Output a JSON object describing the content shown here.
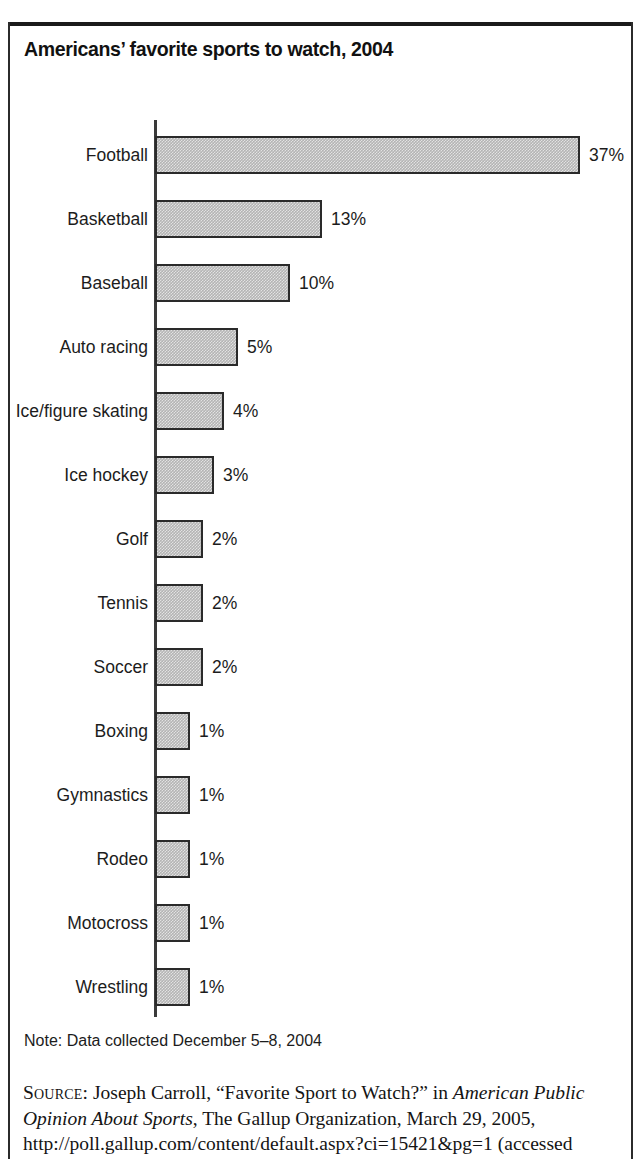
{
  "figure": {
    "title": "Americans’ favorite sports to watch, 2004",
    "note": "Note: Data collected December 5–8, 2004",
    "source": {
      "label": "Source:",
      "text_before_italic": " Joseph Carroll, “Favorite Sport to Watch?” in ",
      "italic_title": "American Public Opinion About Sports",
      "text_after_italic": ", The Gallup Organization, March 29, 2005, http://poll.gallup.com/content/default.aspx?ci=15421&pg=1 (accessed"
    }
  },
  "chart_data": {
    "type": "bar",
    "orientation": "horizontal",
    "title": "Americans’ favorite sports to watch, 2004",
    "xlabel": "",
    "ylabel": "",
    "grid": false,
    "legend": null,
    "value_suffix": "%",
    "categories": [
      "Football",
      "Basketball",
      "Baseball",
      "Auto racing",
      "Ice/figure skating",
      "Ice hockey",
      "Golf",
      "Tennis",
      "Soccer",
      "Boxing",
      "Gymnastics",
      "Rodeo",
      "Motocross",
      "Wrestling"
    ],
    "values": [
      37,
      13,
      10,
      5,
      4,
      3,
      2,
      2,
      2,
      1,
      1,
      1,
      1,
      1
    ],
    "value_labels": [
      "37%",
      "13%",
      "10%",
      "5%",
      "4%",
      "3%",
      "2%",
      "2%",
      "2%",
      "1%",
      "1%",
      "1%",
      "1%",
      "1%"
    ],
    "bar_pixel_widths": [
      425,
      167,
      135,
      83,
      69,
      59,
      48,
      48,
      48,
      35,
      35,
      35,
      35,
      35
    ],
    "xlim": [
      0,
      37
    ],
    "colors": {
      "bar_fill": "#b4b4b4",
      "bar_border": "#2a2a2a",
      "axis": "#3a3a3a",
      "text": "#1c1c1c",
      "frame": "#1a1a1a"
    }
  }
}
